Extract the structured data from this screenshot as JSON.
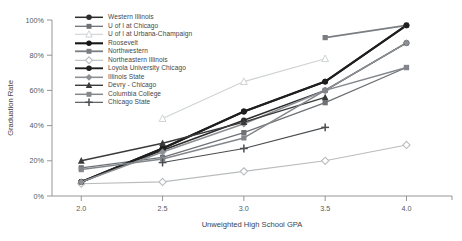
{
  "chart_data": {
    "type": "line",
    "title": "",
    "xlabel": "Unweighted High School GPA",
    "ylabel": "Graduation Rate",
    "x": [
      2.0,
      2.5,
      3.0,
      3.5,
      4.0
    ],
    "xlim": [
      1.82,
      4.28
    ],
    "ylim": [
      0,
      100
    ],
    "xticks": [
      2.0,
      2.5,
      3.0,
      3.5,
      4.0
    ],
    "xtick_labels": [
      "2.0",
      "2.5",
      "3.0",
      "3.5",
      "4.0"
    ],
    "yticks": [
      0,
      20,
      40,
      60,
      80,
      100
    ],
    "ytick_labels": [
      "0%",
      "20%",
      "40%",
      "60%",
      "80%",
      "100%"
    ],
    "grid": false,
    "legend_position": "upper-left-inside",
    "series": [
      {
        "name": "Western Illinois",
        "marker": "circle",
        "color": "#2b2b2b",
        "line_width": 1.5,
        "points": [
          {
            "x": 2.0,
            "y": 8
          },
          {
            "x": 2.5,
            "y": 26
          },
          {
            "x": 3.0,
            "y": 43
          },
          {
            "x": 3.5,
            "y": 60
          },
          {
            "x": 4.0,
            "y": 87
          }
        ]
      },
      {
        "name": "U of I at Chicago",
        "marker": "square",
        "color": "#6e7276",
        "line_width": 1.3,
        "points": [
          {
            "x": 2.0,
            "y": 16
          },
          {
            "x": 2.5,
            "y": 22
          },
          {
            "x": 3.0,
            "y": 36
          },
          {
            "x": 3.5,
            "y": 53
          },
          {
            "x": 4.0,
            "y": 73
          }
        ]
      },
      {
        "name": "U of I at Urbana-Champaign",
        "marker": "triangle-open",
        "color": "#cfd2d4",
        "line_width": 1.1,
        "points": [
          {
            "x": 2.5,
            "y": 44
          },
          {
            "x": 3.0,
            "y": 65
          },
          {
            "x": 3.5,
            "y": 78
          }
        ]
      },
      {
        "name": "Roosevelt",
        "marker": "circle",
        "color": "#171717",
        "line_width": 2.1,
        "points": [
          {
            "x": 2.0,
            "y": 8
          },
          {
            "x": 2.5,
            "y": 27
          },
          {
            "x": 3.0,
            "y": 48
          },
          {
            "x": 3.5,
            "y": 65
          },
          {
            "x": 4.0,
            "y": 97
          }
        ]
      },
      {
        "name": "Northwestern",
        "marker": "square",
        "color": "#7a7e82",
        "line_width": 1.8,
        "points": [
          {
            "x": 3.5,
            "y": 90
          },
          {
            "x": 4.0,
            "y": 97
          }
        ]
      },
      {
        "name": "Northeastern Illinois",
        "marker": "diamond-open",
        "color": "#b9bcbe",
        "line_width": 1.1,
        "points": [
          {
            "x": 2.0,
            "y": 7
          },
          {
            "x": 2.5,
            "y": 8
          },
          {
            "x": 3.0,
            "y": 14
          },
          {
            "x": 3.5,
            "y": 20
          },
          {
            "x": 4.0,
            "y": 29
          }
        ]
      },
      {
        "name": "Loyola University Chicago",
        "marker": "circle",
        "color": "#1f1f1f",
        "line_width": 1.9,
        "points": [
          {
            "x": 2.0,
            "y": 8
          },
          {
            "x": 2.5,
            "y": 27
          },
          {
            "x": 3.0,
            "y": 48
          },
          {
            "x": 3.5,
            "y": 65
          },
          {
            "x": 4.0,
            "y": 97
          }
        ]
      },
      {
        "name": "Illinois State",
        "marker": "diamond",
        "color": "#8d9195",
        "line_width": 1.6,
        "points": [
          {
            "x": 2.0,
            "y": 8
          },
          {
            "x": 2.5,
            "y": 25
          },
          {
            "x": 3.0,
            "y": 41
          },
          {
            "x": 3.5,
            "y": 60
          },
          {
            "x": 4.0,
            "y": 87
          }
        ]
      },
      {
        "name": "Devry - Chicago",
        "marker": "triangle",
        "color": "#3a3a3a",
        "line_width": 1.4,
        "points": [
          {
            "x": 2.0,
            "y": 20
          },
          {
            "x": 2.5,
            "y": 30
          },
          {
            "x": 3.0,
            "y": 42
          },
          {
            "x": 3.5,
            "y": 56
          }
        ]
      },
      {
        "name": "Columbia College",
        "marker": "square",
        "color": "#83878b",
        "line_width": 1.5,
        "points": [
          {
            "x": 2.0,
            "y": 15
          },
          {
            "x": 2.5,
            "y": 21
          },
          {
            "x": 3.0,
            "y": 33
          },
          {
            "x": 3.5,
            "y": 60
          },
          {
            "x": 4.0,
            "y": 73
          }
        ]
      },
      {
        "name": "Chicago State",
        "marker": "plus",
        "color": "#4a4d50",
        "line_width": 1.1,
        "points": [
          {
            "x": 2.5,
            "y": 19
          },
          {
            "x": 3.0,
            "y": 27
          },
          {
            "x": 3.5,
            "y": 39
          }
        ]
      }
    ]
  }
}
